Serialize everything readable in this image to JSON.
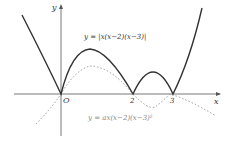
{
  "diagram": {
    "axes": {
      "x_label": "x",
      "y_label": "y",
      "origin_label": "O"
    },
    "ticks": [
      "2",
      "3"
    ],
    "curve_solid": {
      "label": "y = |x(x−2)(x−3)|",
      "style": "solid",
      "color": "#333333"
    },
    "curve_dotted": {
      "label": "y = ax(x−2)(x−3)²",
      "style": "dotted",
      "color": "#888888"
    }
  }
}
